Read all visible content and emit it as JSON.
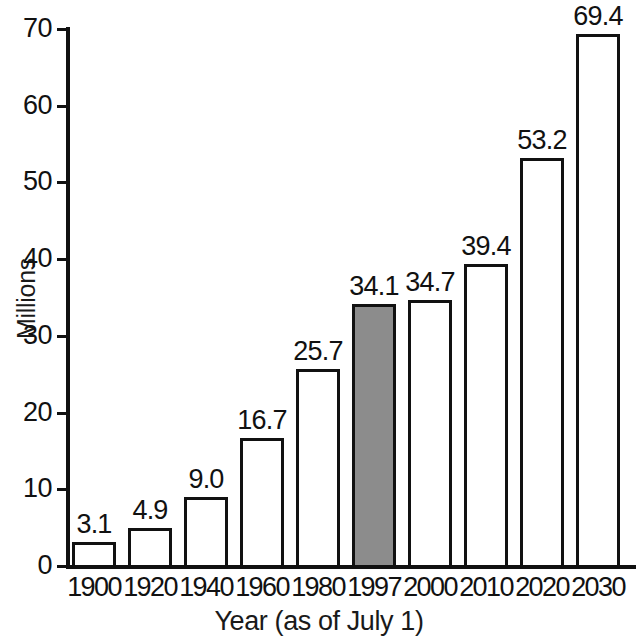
{
  "chart_data": {
    "type": "bar",
    "title": "",
    "subtitle": "",
    "xlabel": "Year (as of July 1)",
    "ylabel": "Millions",
    "categories": [
      "1900",
      "1920",
      "1940",
      "1960",
      "1980",
      "1997",
      "2000",
      "2010",
      "2020",
      "2030"
    ],
    "values": [
      3.1,
      4.9,
      9.0,
      16.7,
      25.7,
      34.1,
      34.7,
      39.4,
      53.2,
      69.4
    ],
    "value_labels": [
      "3.1",
      "4.9",
      "9.0",
      "16.7",
      "25.7",
      "34.1",
      "34.7",
      "39.4",
      "53.2",
      "69.4"
    ],
    "highlighted_index": 5,
    "highlight_color": "#8c8c8c",
    "bar_fill_color": "#ffffff",
    "bar_outline_color": "#111111",
    "ylim": [
      0,
      70
    ],
    "ytick_values": [
      0,
      10,
      20,
      30,
      40,
      50,
      60,
      70
    ],
    "ytick_labels": [
      "0",
      "10",
      "20",
      "30",
      "40",
      "50",
      "60",
      "70"
    ],
    "grid": false,
    "legend": "none",
    "data_labels_shown": true
  },
  "axes": {
    "y_title": "Millions",
    "x_title": "Year (as of July 1)"
  }
}
